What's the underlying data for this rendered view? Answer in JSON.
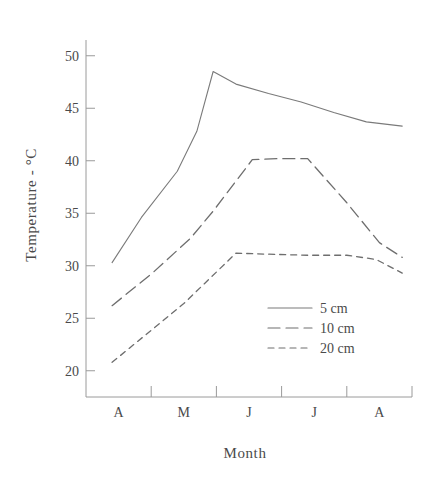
{
  "chart_data": {
    "type": "line",
    "title": "",
    "xlabel": "Month",
    "ylabel": "Temperature - °C",
    "categories": [
      "A",
      "M",
      "J",
      "J",
      "A"
    ],
    "xtick_labels": [
      "A",
      "M",
      "J",
      "J",
      "A"
    ],
    "ytick_labels": [
      "20",
      "25",
      "30",
      "35",
      "40",
      "45",
      "50"
    ],
    "ytick_values": [
      20,
      25,
      30,
      35,
      40,
      45,
      50
    ],
    "ylim": [
      17.5,
      51.5
    ],
    "xlim": [
      0.6,
      5.6
    ],
    "grid": false,
    "legend_position": "inside-lower-right",
    "series": [
      {
        "name": "5 cm",
        "style": "solid",
        "color": "#7a7a7a",
        "x": [
          1.0,
          1.45,
          2.0,
          2.3,
          2.55,
          2.9,
          3.4,
          3.9,
          4.4,
          4.9,
          5.45
        ],
        "values": [
          30.3,
          34.6,
          39.0,
          42.8,
          48.5,
          47.3,
          46.4,
          45.6,
          44.6,
          43.7,
          43.3
        ]
      },
      {
        "name": "10 cm",
        "style": "long-dash",
        "color": "#6e6e6e",
        "x": [
          1.0,
          1.6,
          2.2,
          2.55,
          3.15,
          3.55,
          4.0,
          4.6,
          5.1,
          5.45
        ],
        "values": [
          26.2,
          29.2,
          32.6,
          35.2,
          40.1,
          40.2,
          40.2,
          36.0,
          32.2,
          30.8
        ]
      },
      {
        "name": "20 cm",
        "style": "short-dash",
        "color": "#6e6e6e",
        "x": [
          1.0,
          1.55,
          2.1,
          2.5,
          2.9,
          3.4,
          4.0,
          4.6,
          5.05,
          5.45
        ],
        "values": [
          20.8,
          23.6,
          26.4,
          28.8,
          31.2,
          31.1,
          31.0,
          31.0,
          30.6,
          29.3
        ]
      }
    ]
  },
  "legend": {
    "entries": [
      {
        "label": "5 cm"
      },
      {
        "label": "10 cm"
      },
      {
        "label": "20 cm"
      }
    ]
  },
  "axes": {
    "y_title": "Temperature - °C",
    "x_title": "Month"
  },
  "colors": {
    "axis": "#9a9a9a",
    "text": "#4a4a4a",
    "series_5cm": "#7a7a7a",
    "series_10cm": "#6e6e6e",
    "series_20cm": "#6e6e6e",
    "background": "#ffffff"
  }
}
